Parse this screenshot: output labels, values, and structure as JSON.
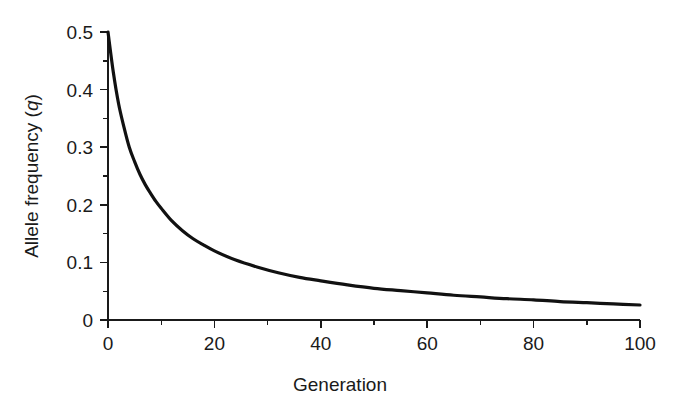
{
  "chart_data": {
    "type": "line",
    "title": "",
    "subtitle": "",
    "xlabel": "Generation",
    "ylabel": "Allele frequency (q)",
    "ylabel_plain": "Allele frequency (",
    "ylabel_italic": "q",
    "ylabel_close": ")",
    "xlim": [
      0,
      100
    ],
    "ylim": [
      0,
      0.5
    ],
    "grid": false,
    "legend": null,
    "legend_position": "none",
    "x_ticks_major": [
      0,
      20,
      40,
      60,
      80,
      100
    ],
    "x_tick_labels": [
      "0",
      "20",
      "40",
      "60",
      "80",
      "100"
    ],
    "x_ticks_minor": [
      10,
      30,
      50,
      70,
      90
    ],
    "y_ticks_major": [
      0,
      0.1,
      0.2,
      0.3,
      0.4,
      0.5
    ],
    "y_tick_labels": [
      "0",
      "0.1",
      "0.2",
      "0.3",
      "0.4",
      "0.5"
    ],
    "y_ticks_minor": [
      0.05,
      0.15,
      0.25,
      0.35,
      0.45
    ],
    "series": [
      {
        "name": "Allele frequency q",
        "color": "#111111",
        "x": [
          0,
          1,
          2,
          3,
          4,
          5,
          6,
          7,
          8,
          9,
          10,
          12,
          14,
          16,
          18,
          20,
          24,
          28,
          32,
          36,
          40,
          45,
          50,
          55,
          60,
          65,
          70,
          75,
          80,
          85,
          90,
          95,
          100
        ],
        "y": [
          0.5,
          0.43,
          0.375,
          0.335,
          0.3,
          0.275,
          0.253,
          0.235,
          0.22,
          0.206,
          0.194,
          0.172,
          0.155,
          0.141,
          0.13,
          0.12,
          0.104,
          0.092,
          0.082,
          0.074,
          0.068,
          0.061,
          0.055,
          0.051,
          0.047,
          0.043,
          0.04,
          0.037,
          0.035,
          0.032,
          0.03,
          0.028,
          0.026
        ]
      }
    ]
  },
  "figure": {
    "background_color": "#ffffff",
    "line_color": "#111111",
    "text_color": "#1a1a1a"
  }
}
